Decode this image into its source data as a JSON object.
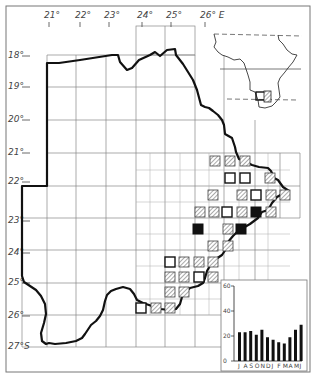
{
  "map": {
    "longitude_labels": [
      {
        "text": "21°",
        "x": 44
      },
      {
        "text": "22°",
        "x": 75
      },
      {
        "text": "23°",
        "x": 104
      },
      {
        "text": "24°",
        "x": 137
      },
      {
        "text": "25°",
        "x": 166
      },
      {
        "text": "26° E",
        "x": 200
      }
    ],
    "latitude_labels": [
      {
        "text": "18°",
        "y": 58
      },
      {
        "text": "19°",
        "y": 89
      },
      {
        "text": "20°",
        "y": 122
      },
      {
        "text": "21°",
        "y": 155
      },
      {
        "text": "22°",
        "y": 184
      },
      {
        "text": "23°",
        "y": 223
      },
      {
        "text": "24°",
        "y": 255
      },
      {
        "text": "25°",
        "y": 285
      },
      {
        "text": "26°",
        "y": 318
      },
      {
        "text": "27°S",
        "y": 349
      }
    ],
    "legend_symbols": {
      "open": "open-square",
      "hatched": "hatched-square",
      "filled": "filled-square"
    },
    "records": [
      {
        "type": "hatched",
        "x": 215,
        "y": 161
      },
      {
        "type": "hatched",
        "x": 230,
        "y": 161
      },
      {
        "type": "hatched",
        "x": 245,
        "y": 161
      },
      {
        "type": "open",
        "x": 230,
        "y": 178
      },
      {
        "type": "open",
        "x": 245,
        "y": 178
      },
      {
        "type": "hatched",
        "x": 270,
        "y": 178
      },
      {
        "type": "hatched",
        "x": 213,
        "y": 195
      },
      {
        "type": "hatched",
        "x": 242,
        "y": 195
      },
      {
        "type": "open",
        "x": 256,
        "y": 195
      },
      {
        "type": "hatched",
        "x": 271,
        "y": 195
      },
      {
        "type": "hatched",
        "x": 285,
        "y": 195
      },
      {
        "type": "hatched",
        "x": 200,
        "y": 212
      },
      {
        "type": "hatched",
        "x": 214,
        "y": 212
      },
      {
        "type": "open",
        "x": 227,
        "y": 212
      },
      {
        "type": "hatched",
        "x": 242,
        "y": 212
      },
      {
        "type": "filled",
        "x": 256,
        "y": 212
      },
      {
        "type": "hatched",
        "x": 271,
        "y": 212
      },
      {
        "type": "filled",
        "x": 198,
        "y": 229
      },
      {
        "type": "hatched",
        "x": 228,
        "y": 229
      },
      {
        "type": "filled",
        "x": 241,
        "y": 229
      },
      {
        "type": "hatched",
        "x": 213,
        "y": 246
      },
      {
        "type": "hatched",
        "x": 228,
        "y": 246
      },
      {
        "type": "open",
        "x": 170,
        "y": 262
      },
      {
        "type": "hatched",
        "x": 184,
        "y": 262
      },
      {
        "type": "hatched",
        "x": 199,
        "y": 262
      },
      {
        "type": "hatched",
        "x": 213,
        "y": 262
      },
      {
        "type": "hatched",
        "x": 170,
        "y": 277
      },
      {
        "type": "hatched",
        "x": 184,
        "y": 277
      },
      {
        "type": "open",
        "x": 199,
        "y": 277
      },
      {
        "type": "hatched",
        "x": 213,
        "y": 277
      },
      {
        "type": "hatched",
        "x": 170,
        "y": 292
      },
      {
        "type": "hatched",
        "x": 184,
        "y": 292
      },
      {
        "type": "open",
        "x": 141,
        "y": 308
      },
      {
        "type": "hatched",
        "x": 156,
        "y": 308
      },
      {
        "type": "hatched",
        "x": 170,
        "y": 308
      }
    ],
    "inset": {
      "title": "Africa locator inset",
      "highlight": "Botswana"
    }
  },
  "chart_data": {
    "type": "bar",
    "title": "",
    "xlabel": "",
    "ylabel": "",
    "categories": [
      "J",
      "A",
      "S",
      "O",
      "N",
      "D",
      "J",
      "F",
      "M",
      "A",
      "M",
      "J"
    ],
    "values": [
      23,
      23,
      24,
      21,
      25,
      19,
      17,
      15,
      14,
      19,
      25,
      29
    ],
    "yticks": [
      0,
      20,
      40,
      60
    ],
    "ylim": [
      0,
      60
    ],
    "grid": false,
    "legend": null
  }
}
